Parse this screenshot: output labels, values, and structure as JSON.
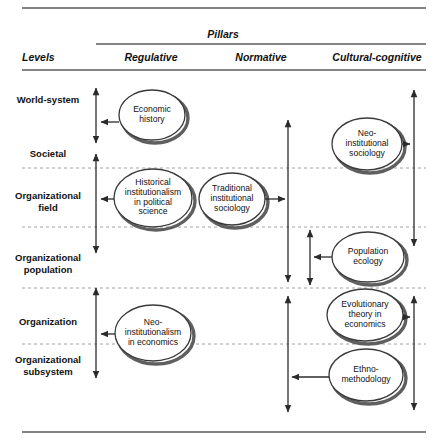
{
  "figure": {
    "title": "Pillars",
    "levels_header": "Levels",
    "pillars": [
      {
        "id": "regulative",
        "label": "Regulative"
      },
      {
        "id": "normative",
        "label": "Normative"
      },
      {
        "id": "cultural-cognitive",
        "label": "Cultural-cognitive"
      }
    ],
    "levels": [
      {
        "id": "world-system",
        "label": "World-system",
        "x": 48,
        "y": 100
      },
      {
        "id": "societal",
        "label": "Societal",
        "x": 48,
        "y": 154
      },
      {
        "id": "organizational-field",
        "label": "Organizational\nfield",
        "x": 48,
        "y": 196
      },
      {
        "id": "organizational-population",
        "label": "Organizational\npopulation",
        "x": 48,
        "y": 258
      },
      {
        "id": "organization",
        "label": "Organization",
        "x": 48,
        "y": 322
      },
      {
        "id": "organizational-subsystem",
        "label": "Organizational\nsubsystem",
        "x": 48,
        "y": 360
      }
    ],
    "nodes": [
      {
        "id": "economic-history",
        "label": "Economic\nhistory",
        "pillar": "regulative",
        "cx": 152,
        "cy": 115,
        "rx": 33,
        "ry": 25
      },
      {
        "id": "historical-institutionalism",
        "label": "Historical\ninstitutionalism\nin political\nscience",
        "pillar": "regulative",
        "cx": 153,
        "cy": 198,
        "rx": 39,
        "ry": 29
      },
      {
        "id": "traditional-institutional-sociology",
        "label": "Traditional\ninstitutional\nsociology",
        "pillar": "normative",
        "cx": 232,
        "cy": 199,
        "rx": 33,
        "ry": 26
      },
      {
        "id": "neo-institutionalism-economics",
        "label": "Neo-\ninstitutionalism\nin economics",
        "pillar": "regulative",
        "cx": 153,
        "cy": 333,
        "rx": 38,
        "ry": 28
      },
      {
        "id": "neo-institutional-sociology",
        "label": "Neo-\ninstitutional\nsociology",
        "pillar": "cultural-cognitive",
        "cx": 367,
        "cy": 144,
        "rx": 35,
        "ry": 26
      },
      {
        "id": "population-ecology",
        "label": "Population\necology",
        "pillar": "cultural-cognitive",
        "cx": 368,
        "cy": 257,
        "rx": 36,
        "ry": 25
      },
      {
        "id": "evolutionary-theory-economics",
        "label": "Evolutionary\ntheory in\neconomics",
        "pillar": "cultural-cognitive",
        "cx": 365,
        "cy": 315,
        "rx": 38,
        "ry": 26
      },
      {
        "id": "ethnomethodology",
        "label": "Ethno-\nmethodology",
        "pillar": "cultural-cognitive",
        "cx": 366,
        "cy": 375,
        "rx": 37,
        "ry": 26
      }
    ],
    "dividers_y": [
      168,
      227,
      288,
      344
    ],
    "rules": {
      "top_y": 8,
      "pillars_y": 44,
      "header_y": 70,
      "bottom_y": 432,
      "left_x": 22,
      "right_x": 426,
      "pillars_left_x": 96
    },
    "span_arrows": [
      {
        "id": "span-world-system",
        "x": 96,
        "y1": 88,
        "y2": 143
      },
      {
        "id": "span-societal-field",
        "x": 96,
        "y1": 154,
        "y2": 253
      },
      {
        "id": "span-organization",
        "x": 96,
        "y1": 288,
        "y2": 378
      },
      {
        "id": "span-normative-main",
        "x": 288,
        "y1": 120,
        "y2": 282
      },
      {
        "id": "span-normative-population",
        "x": 310,
        "y1": 230,
        "y2": 285
      },
      {
        "id": "span-normative-lower",
        "x": 288,
        "y1": 296,
        "y2": 412
      },
      {
        "id": "span-cultural-upper",
        "x": 414,
        "y1": 90,
        "y2": 246
      },
      {
        "id": "span-cultural-lower",
        "x": 414,
        "y1": 296,
        "y2": 410
      }
    ],
    "connectors": [
      {
        "id": "conn-economic-history",
        "from": "economic-history",
        "to_x": 101,
        "y": 122,
        "dir": "left"
      },
      {
        "id": "conn-historical-institutionalism",
        "from": "historical-institutionalism",
        "to_x": 101,
        "y": 199,
        "dir": "left"
      },
      {
        "id": "conn-traditional-sociology",
        "from": "traditional-institutional-sociology",
        "to_x": 285,
        "y": 199,
        "dir": "right"
      },
      {
        "id": "conn-neo-institutionalism-econ",
        "from": "neo-institutionalism-economics",
        "to_x": 101,
        "y": 334,
        "dir": "left"
      },
      {
        "id": "conn-neo-institutional-sociology",
        "from": "neo-institutional-sociology",
        "to_x": 410,
        "y": 144,
        "dir": "right"
      },
      {
        "id": "conn-population-ecology",
        "from": "population-ecology",
        "to_x": 314,
        "y": 257,
        "dir": "left"
      },
      {
        "id": "conn-evolutionary-theory",
        "from": "evolutionary-theory-economics",
        "to_x": 410,
        "y": 317,
        "dir": "right"
      },
      {
        "id": "conn-ethnomethodology",
        "from": "ethnomethodology",
        "to_x": 292,
        "y": 377,
        "dir": "left"
      }
    ],
    "colors": {
      "rule": "#5a5a5a",
      "dashed": "#9a9a9a",
      "ellipse_stroke": "#3a3a3a",
      "ellipse_shadow": "#5f5f5f",
      "ellipse_fill": "#ffffff",
      "arrow": "#2b2b2b",
      "text": "#111111"
    }
  }
}
